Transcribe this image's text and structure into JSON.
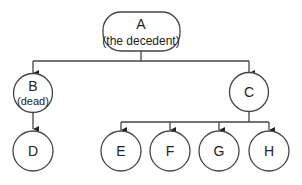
{
  "diagram": {
    "type": "family-tree",
    "colors": {
      "stroke": "#444444",
      "text": "#222222",
      "background": "#ffffff"
    },
    "nodes": {
      "A": {
        "label": "A",
        "sublabel": "(the decedent)",
        "shape": "rounded-rect"
      },
      "B": {
        "label": "B",
        "sublabel": "(dead)",
        "shape": "circle"
      },
      "C": {
        "label": "C",
        "shape": "circle"
      },
      "D": {
        "label": "D",
        "shape": "circle"
      },
      "E": {
        "label": "E",
        "shape": "circle"
      },
      "F": {
        "label": "F",
        "shape": "circle"
      },
      "G": {
        "label": "G",
        "shape": "circle"
      },
      "H": {
        "label": "H",
        "shape": "circle"
      }
    },
    "edges": [
      {
        "from": "A",
        "to": "B"
      },
      {
        "from": "A",
        "to": "C"
      },
      {
        "from": "B",
        "to": "D"
      },
      {
        "from": "C",
        "to": "E"
      },
      {
        "from": "C",
        "to": "F"
      },
      {
        "from": "C",
        "to": "G"
      },
      {
        "from": "C",
        "to": "H"
      }
    ]
  }
}
